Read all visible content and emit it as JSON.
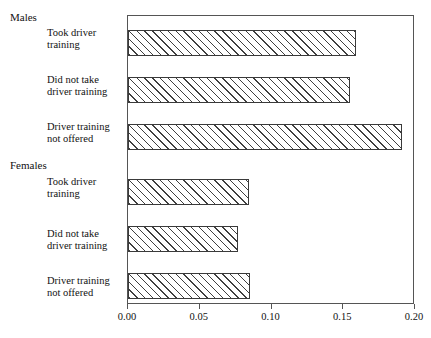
{
  "chart_data": {
    "type": "bar",
    "orientation": "horizontal",
    "title": "",
    "xlabel": "",
    "ylabel": "",
    "xlim": [
      0.0,
      0.2
    ],
    "grid": false,
    "legend": "none",
    "xticks": [
      "0.00",
      "0.05",
      "0.10",
      "0.15",
      "0.20"
    ],
    "xtick_values": [
      0.0,
      0.05,
      0.1,
      0.15,
      0.2
    ],
    "groups": [
      {
        "name": "Males",
        "categories": [
          "Took driver training",
          "Did not take driver training",
          "Driver training not offered"
        ],
        "values": [
          0.159,
          0.155,
          0.191
        ]
      },
      {
        "name": "Females",
        "categories": [
          "Took driver training",
          "Did not take driver training",
          "Driver training not offered"
        ],
        "values": [
          0.084,
          0.077,
          0.085
        ]
      }
    ],
    "categories": [
      "Males - Took driver training",
      "Males - Did not take driver training",
      "Males - Driver training not offered",
      "Females - Took driver training",
      "Females - Did not take driver training",
      "Females - Driver training not offered"
    ],
    "values": [
      0.159,
      0.155,
      0.191,
      0.084,
      0.077,
      0.085
    ],
    "bar_fill": "diagonal-hatch",
    "bar_edge_color": "#3a3a3a",
    "bar_fill_color": "#ffffff",
    "frame_color": "#555555"
  },
  "groups": {
    "males_label": "Males",
    "females_label": "Females"
  },
  "bars": [
    {
      "line1": "Took driver",
      "line2": "training",
      "value": 0.159
    },
    {
      "line1": "Did not take",
      "line2": "driver training",
      "value": 0.155
    },
    {
      "line1": "Driver training",
      "line2": "not offered",
      "value": 0.191
    },
    {
      "line1": "Took driver",
      "line2": "training",
      "value": 0.084
    },
    {
      "line1": "Did not take",
      "line2": "driver training",
      "value": 0.077
    },
    {
      "line1": "Driver training",
      "line2": "not offered",
      "value": 0.085
    }
  ],
  "axis": {
    "ticks": [
      {
        "label": "0.00",
        "value": 0.0
      },
      {
        "label": "0.05",
        "value": 0.05
      },
      {
        "label": "0.10",
        "value": 0.1
      },
      {
        "label": "0.15",
        "value": 0.15
      },
      {
        "label": "0.20",
        "value": 0.2
      }
    ]
  }
}
